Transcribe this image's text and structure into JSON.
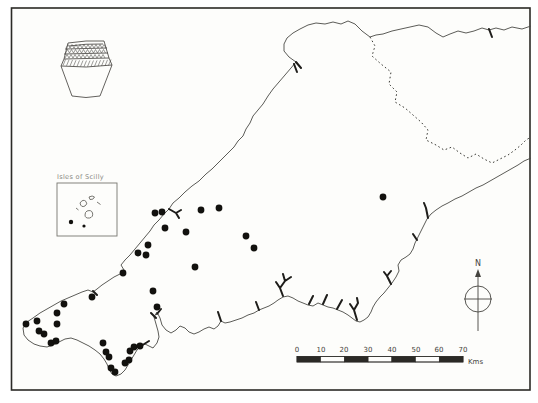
{
  "figure": {
    "inset_label": "Isles of Scilly",
    "north_label": "N",
    "scalebar": {
      "labels": [
        "0",
        "10",
        "20",
        "30",
        "40",
        "50",
        "60",
        "70"
      ],
      "unit": "Kms",
      "segment_km": 10,
      "total_km": 70
    },
    "colors": {
      "ink": "#2b2a26",
      "coast": "#4a4a45",
      "dot": "#12110e",
      "paper": "#fdfdfb"
    }
  },
  "map_data": {
    "type": "distribution-map",
    "region_shown": "south-west England (Cornwall and Devon) with Isles of Scilly inset",
    "symbol": "filled-circle",
    "dot_radius_px": 3.4,
    "sites": [
      [
        92,
        297
      ],
      [
        64,
        304
      ],
      [
        57,
        313
      ],
      [
        37,
        321
      ],
      [
        26,
        324
      ],
      [
        57,
        324
      ],
      [
        39,
        331
      ],
      [
        44,
        334
      ],
      [
        51,
        343
      ],
      [
        56,
        341
      ],
      [
        123,
        273
      ],
      [
        153,
        291
      ],
      [
        157,
        307
      ],
      [
        148,
        245
      ],
      [
        138,
        253
      ],
      [
        146,
        255
      ],
      [
        155,
        213
      ],
      [
        162,
        212
      ],
      [
        165,
        228
      ],
      [
        186,
        232
      ],
      [
        201,
        210
      ],
      [
        219,
        208
      ],
      [
        246,
        236
      ],
      [
        254,
        248
      ],
      [
        195,
        267
      ],
      [
        383,
        197
      ],
      [
        103,
        343
      ],
      [
        106,
        352
      ],
      [
        109,
        357
      ],
      [
        111,
        368
      ],
      [
        115,
        372
      ],
      [
        130,
        351
      ],
      [
        134,
        347
      ],
      [
        140,
        346
      ],
      [
        129,
        360
      ],
      [
        125,
        363
      ]
    ],
    "scilly_sites": [
      [
        71,
        222,
        2.2
      ],
      [
        84,
        226,
        1.6
      ]
    ]
  }
}
